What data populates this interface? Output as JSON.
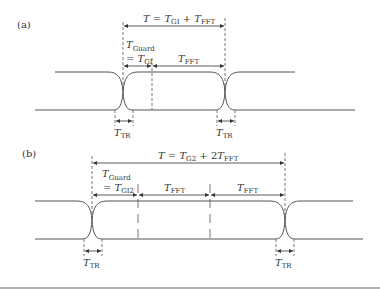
{
  "panels": {
    "a": {
      "label": "(a)",
      "total_eq": {
        "T": "T",
        "eq": " = ",
        "t1": "T",
        "s1": "GI",
        "plus": " + ",
        "t2": "T",
        "s2": "FFT"
      },
      "guard": {
        "T": "T",
        "sub": "Guard",
        "eq": "= ",
        "t": "T",
        "s": "GI"
      },
      "fft": {
        "T": "T",
        "sub": "FFT"
      },
      "tr_left": {
        "T": "T",
        "sub": "TR"
      },
      "tr_right": {
        "T": "T",
        "sub": "TR"
      }
    },
    "b": {
      "label": "(b)",
      "total_eq": {
        "T": "T",
        "eq": " = ",
        "t1": "T",
        "s1": "G2",
        "plus": " + 2",
        "t2": "T",
        "s2": "FFT"
      },
      "guard": {
        "T": "T",
        "sub": "Guard",
        "eq": "= ",
        "t": "T",
        "s": "GI2"
      },
      "fft1": {
        "T": "T",
        "sub": "FFT"
      },
      "fft2": {
        "T": "T",
        "sub": "FFT"
      },
      "tr_left": {
        "T": "T",
        "sub": "TR"
      },
      "tr_right": {
        "T": "T",
        "sub": "TR"
      }
    }
  },
  "colors": {
    "line": "#444444",
    "text": "#333333"
  }
}
